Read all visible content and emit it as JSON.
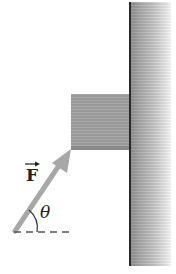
{
  "diagram": {
    "type": "physics-free-body",
    "labels": {
      "force": "F",
      "angle": "θ"
    },
    "elements": {
      "wall": {
        "color_edge": "#2a2a2a",
        "color_fill": "#a9a9a9"
      },
      "block": {
        "color_fill": "#a2a2a2"
      },
      "force_arrow": {
        "color": "#a8a8a8"
      },
      "reference_line": {
        "style": "dashed",
        "color": "#555555"
      }
    }
  }
}
